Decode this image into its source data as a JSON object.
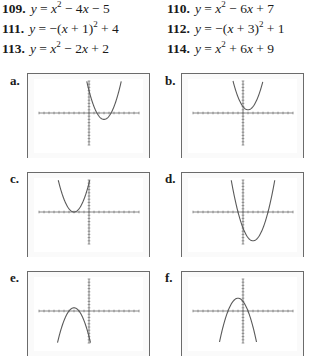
{
  "exercises": [
    {
      "num": "109.",
      "lhs": "y",
      "expr_html": "x<sup>2</sup> − 4<i>x</i> − 5",
      "text": "y = x^2 - 4x - 5"
    },
    {
      "num": "110.",
      "lhs": "y",
      "expr_html": "x<sup>2</sup> − 6<i>x</i> + 7",
      "text": "y = x^2 - 6x + 7"
    },
    {
      "num": "111.",
      "lhs": "y",
      "expr_html": "−(<i>x</i> + 1)<sup>2</sup> + 4",
      "text": "y = -(x + 1)^2 + 4"
    },
    {
      "num": "112.",
      "lhs": "y",
      "expr_html": "−(<i>x</i> + 3)<sup>2</sup> + 1",
      "text": "y = -(x + 3)^2 + 1"
    },
    {
      "num": "113.",
      "lhs": "y",
      "expr_html": "x<sup>2</sup> − 2<i>x</i> + 2",
      "text": "y = x^2 - 2x + 2"
    },
    {
      "num": "114.",
      "lhs": "y",
      "expr_html": "x<sup>2</sup> + 6<i>x</i> + 9",
      "text": "y = x^2 + 6x + 9"
    }
  ],
  "plots": [
    {
      "label": "a.",
      "a": 1,
      "h": 3,
      "k": -2
    },
    {
      "label": "b.",
      "a": 1,
      "h": 1,
      "k": 1
    },
    {
      "label": "c.",
      "a": 1,
      "h": -3,
      "k": 0
    },
    {
      "label": "d.",
      "a": 1,
      "h": 2,
      "k": -9
    },
    {
      "label": "e.",
      "a": -1,
      "h": -3,
      "k": 1
    },
    {
      "label": "f.",
      "a": -1,
      "h": -1,
      "k": 4
    }
  ],
  "chart_data": {
    "type": "line",
    "window": {
      "xmin": -10,
      "xmax": 10,
      "ymin": -10,
      "ymax": 10,
      "xscl": 1,
      "yscl": 1
    },
    "series": [
      {
        "name": "a.",
        "equation": "y = x^2 - 6x + 7",
        "vertex": [
          3,
          -2
        ]
      },
      {
        "name": "b.",
        "equation": "y = x^2 - 2x + 2",
        "vertex": [
          1,
          1
        ]
      },
      {
        "name": "c.",
        "equation": "y = x^2 + 6x + 9",
        "vertex": [
          -3,
          0
        ]
      },
      {
        "name": "d.",
        "equation": "y = x^2 - 4x - 5",
        "vertex": [
          2,
          -9
        ]
      },
      {
        "name": "e.",
        "equation": "y = -(x + 3)^2 + 1",
        "vertex": [
          -3,
          1
        ]
      },
      {
        "name": "f.",
        "equation": "y = -(x + 1)^2 + 4",
        "vertex": [
          -1,
          4
        ]
      }
    ],
    "grid": false
  }
}
